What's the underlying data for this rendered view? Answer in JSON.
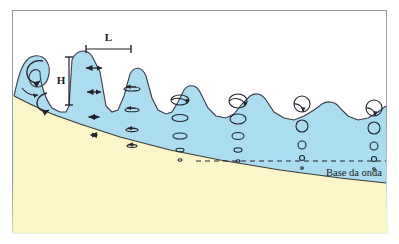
{
  "figure": {
    "border_color": "#9a9a9a",
    "background": "#ffffff"
  },
  "colors": {
    "water_fill": "#ACDCEF",
    "water_stroke": "#3a3a4a",
    "sand_fill": "#FAF6C8",
    "sand_stroke": "#3a3a3a",
    "ink": "#23232e",
    "dashed_line": "#23232e",
    "border": "#9a9a9a"
  },
  "labels": {
    "wavelength": "L",
    "wave_height": "H",
    "wave_base": "Base da onda"
  },
  "measures": {
    "wavelength_bar": {
      "x1": 86,
      "x2": 131,
      "y": 49,
      "label_y": 41
    },
    "height_bar": {
      "x": 69,
      "y1": 57,
      "y2": 105,
      "label_x": 61,
      "label_y": 84
    }
  },
  "wave_base_line": {
    "y": 161,
    "x_start": 196,
    "x_end": 386,
    "dash": "5,4",
    "label_x": 382,
    "label_y": 176
  },
  "orbit_columns": [
    {
      "name": "breaking-arrows",
      "x": 94,
      "kind": "double-arrow",
      "items": [
        {
          "y": 68,
          "w": 16
        },
        {
          "y": 92,
          "w": 14
        },
        {
          "y": 117,
          "w": 11
        },
        {
          "y": 135,
          "w": 7
        }
      ]
    },
    {
      "name": "flat-ellipses",
      "x": 132,
      "kind": "flat-ellipse",
      "items": [
        {
          "y": 89,
          "rx": 8,
          "ry": 2.0
        },
        {
          "y": 110,
          "rx": 7,
          "ry": 1.8
        },
        {
          "y": 130,
          "rx": 6,
          "ry": 1.6
        },
        {
          "y": 146,
          "rx": 5,
          "ry": 1.4
        }
      ]
    },
    {
      "name": "ellipses-mid",
      "x": 180,
      "kind": "ellipse",
      "items": [
        {
          "y": 100,
          "rx": 9,
          "ry": 5
        },
        {
          "y": 118,
          "rx": 8,
          "ry": 3.5
        },
        {
          "y": 136,
          "rx": 7,
          "ry": 3
        },
        {
          "y": 150,
          "rx": 4,
          "ry": 1.8
        },
        {
          "y": 160,
          "rx": 2,
          "ry": 1.2
        }
      ]
    },
    {
      "name": "ellipses-outer",
      "x": 238,
      "kind": "ellipse",
      "items": [
        {
          "y": 101,
          "rx": 9,
          "ry": 7
        },
        {
          "y": 119,
          "rx": 8,
          "ry": 5
        },
        {
          "y": 136,
          "rx": 6,
          "ry": 3.5
        },
        {
          "y": 150,
          "rx": 4,
          "ry": 2.2
        },
        {
          "y": 161,
          "rx": 2,
          "ry": 1.2
        }
      ]
    },
    {
      "name": "circles-deep",
      "x": 302,
      "kind": "circle",
      "items": [
        {
          "y": 104,
          "r": 8
        },
        {
          "y": 126,
          "r": 6
        },
        {
          "y": 145,
          "r": 4
        },
        {
          "y": 158,
          "r": 2.5
        },
        {
          "y": 168,
          "r": 1.3
        }
      ]
    },
    {
      "name": "circles-deepest",
      "x": 374,
      "kind": "circle",
      "items": [
        {
          "y": 108,
          "r": 8
        },
        {
          "y": 128,
          "r": 6
        },
        {
          "y": 146,
          "r": 4
        },
        {
          "y": 159,
          "r": 2.5
        },
        {
          "y": 169,
          "r": 1.3
        }
      ]
    }
  ],
  "geometry": {
    "water_surface_path": "M 14 96 C 18 78 22 58 34 56 C 46 54 52 66 48 78 C 45 88 34 90 30 82 C 27 75 32 68 38 70 L 40 72 C 40 84 46 100 52 108 L 60 112 L 66 112 L 69 106 L 72 60 C 76 50 86 48 92 56 L 100 72 L 106 106 L 112 112 L 118 110 L 124 96 L 130 74 C 134 66 142 66 146 76 L 152 98 L 158 110 L 166 114 L 172 112 L 178 102 L 184 90 C 188 84 196 84 200 92 L 208 108 L 216 116 L 226 118 L 234 114 L 242 104 L 250 96 C 256 92 262 94 266 100 L 274 112 L 284 118 L 294 120 L 304 116 L 314 110 L 322 104 C 328 100 336 102 340 108 L 348 116 L 358 120 L 368 118 L 378 112 L 386 106",
    "seafloor_path": "M 14 96 L 30 104 L 52 114 L 80 124 L 120 137 L 170 150 L 220 160 L 280 170 L 340 178 L 386 183",
    "plot_rect": {
      "x": 12,
      "y": 10,
      "w": 375,
      "h": 223
    }
  },
  "zones": {
    "breaking": "Breaking wave with curling crest",
    "shallow": "Flattened elliptical orbits",
    "deep": "Circular orbits decreasing with depth"
  }
}
